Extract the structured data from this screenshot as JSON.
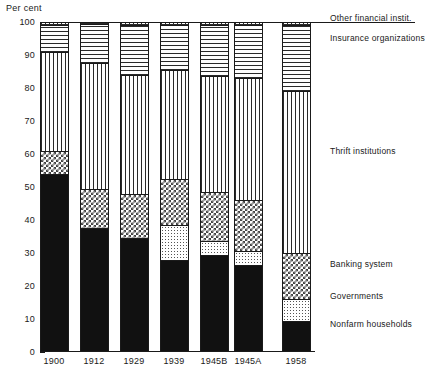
{
  "axis": {
    "y_title": "Per cent",
    "y_ticks": [
      "100",
      "90",
      "80",
      "70",
      "60",
      "50",
      "40",
      "30",
      "20",
      "10",
      "0"
    ],
    "x_labels": [
      "1900",
      "1912",
      "1929",
      "1939",
      "1945B",
      "1945A",
      "1958"
    ]
  },
  "legend": [
    {
      "key": "other",
      "label": "Other financial instit.",
      "pattern": "grid"
    },
    {
      "key": "insurance",
      "label": "Insurance organizations",
      "pattern": "hline"
    },
    {
      "key": "thrift",
      "label": "Thrift institutions",
      "pattern": "vline"
    },
    {
      "key": "banking",
      "label": "Banking system",
      "pattern": "check"
    },
    {
      "key": "governments",
      "label": "Governments",
      "pattern": "dots"
    },
    {
      "key": "households",
      "label": "Nonfarm households",
      "pattern": "solid"
    }
  ],
  "chart_data": {
    "type": "bar",
    "title": "",
    "subtitle": "",
    "xlabel": "",
    "ylabel": "Per cent",
    "ylim": [
      0,
      100
    ],
    "ytick_step": 10,
    "grid": false,
    "legend_position": "right",
    "stacked": true,
    "stack_order_bottom_to_top": [
      "Nonfarm households",
      "Governments",
      "Banking system",
      "Thrift institutions",
      "Insurance organizations",
      "Other financial instit."
    ],
    "categories": [
      "1900",
      "1912",
      "1929",
      "1939",
      "1945B",
      "1945A",
      "1958"
    ],
    "series": [
      {
        "name": "Nonfarm households",
        "pattern": "solid",
        "values": [
          54,
          37.5,
          34.5,
          28,
          29.5,
          26.5,
          9.5
        ]
      },
      {
        "name": "Governments",
        "pattern": "dots",
        "values": [
          0,
          0,
          0,
          10.5,
          4,
          4,
          6.5
        ]
      },
      {
        "name": "Banking system",
        "pattern": "check",
        "values": [
          7,
          12,
          13.5,
          14,
          15,
          15.5,
          14
        ]
      },
      {
        "name": "Thrift institutions",
        "pattern": "vline",
        "values": [
          30,
          38,
          36,
          33,
          35,
          37,
          49
        ]
      },
      {
        "name": "Insurance organizations",
        "pattern": "hline",
        "values": [
          8,
          12,
          15,
          13.5,
          15.5,
          16,
          20
        ]
      },
      {
        "name": "Other financial instit.",
        "pattern": "grid",
        "values": [
          1,
          0.5,
          1,
          1,
          1,
          1,
          1
        ]
      }
    ]
  }
}
